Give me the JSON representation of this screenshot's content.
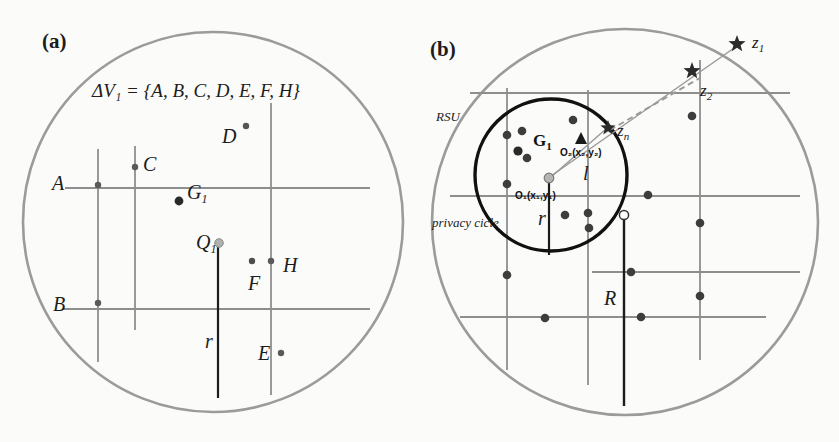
{
  "figure": {
    "background_color": "#fbfbf9",
    "width": 839,
    "height": 442
  },
  "panels": [
    {
      "tag": "(a)",
      "tag_x": 42,
      "tag_y": 48,
      "boundary": {
        "name": "coverage-circle",
        "cx": 213,
        "cy": 222,
        "r": 190,
        "color": "#9b9b9b",
        "stroke_width": 2.6
      },
      "formula": "ΔV₁ = {A, B, C, D, E, F, H}",
      "formula_x": 92,
      "formula_y": 97,
      "roads": [
        {
          "name": "road-vertical-1",
          "x1": 98,
          "y1": 149,
          "x2": 98,
          "y2": 362,
          "color": "#8e8e8e",
          "w": 1.8
        },
        {
          "name": "road-vertical-2",
          "x1": 135,
          "y1": 146,
          "x2": 135,
          "y2": 330,
          "color": "#8e8e8e",
          "w": 1.8
        },
        {
          "name": "road-vertical-3",
          "x1": 271,
          "y1": 103,
          "x2": 271,
          "y2": 395,
          "color": "#8e8e8e",
          "w": 1.8
        },
        {
          "name": "road-horizontal-1",
          "x1": 65,
          "y1": 188,
          "x2": 370,
          "y2": 188,
          "color": "#8e8e8e",
          "w": 1.8
        },
        {
          "name": "road-horizontal-2",
          "x1": 62,
          "y1": 309,
          "x2": 370,
          "y2": 309,
          "color": "#8e8e8e",
          "w": 1.8
        },
        {
          "name": "road-vertical-bold-r",
          "x1": 218,
          "y1": 243,
          "x2": 218,
          "y2": 398,
          "color": "#1c1c1c",
          "w": 2.2
        }
      ],
      "vehicles": [
        {
          "name": "vehicle-A",
          "label": "A",
          "lx": 52,
          "ly": 190,
          "cx": 98,
          "cy": 185,
          "r": 3.2,
          "fill": "#5a5a5a",
          "sub": ""
        },
        {
          "name": "vehicle-C",
          "label": "C",
          "lx": 143,
          "ly": 171,
          "cx": 135,
          "cy": 167,
          "r": 3.2,
          "fill": "#5a5a5a",
          "sub": ""
        },
        {
          "name": "vehicle-D",
          "label": "D",
          "lx": 222,
          "ly": 143,
          "cx": 246,
          "cy": 126,
          "r": 3.2,
          "fill": "#555555",
          "sub": ""
        },
        {
          "name": "vehicle-B",
          "label": "B",
          "lx": 53,
          "ly": 311,
          "cx": 98,
          "cy": 303,
          "r": 3.2,
          "fill": "#5a5a5a",
          "sub": ""
        },
        {
          "name": "vehicle-F",
          "label": "F",
          "lx": 248,
          "ly": 290,
          "cx": 252,
          "cy": 261,
          "r": 3.2,
          "fill": "#4e4e4e",
          "sub": ""
        },
        {
          "name": "vehicle-H",
          "label": "H",
          "lx": 283,
          "ly": 272,
          "cx": 271,
          "cy": 261,
          "r": 3.2,
          "fill": "#5a5a5a",
          "sub": ""
        },
        {
          "name": "vehicle-E",
          "label": "E",
          "lx": 258,
          "ly": 360,
          "cx": 281,
          "cy": 353,
          "r": 3.2,
          "fill": "#5a5a5a",
          "sub": ""
        }
      ],
      "group_point": {
        "name": "group-center-G1",
        "label": "G",
        "sub": "1",
        "lx": 187,
        "ly": 199,
        "cx": 179,
        "cy": 201,
        "r": 4.4,
        "fill": "#2a2a2a"
      },
      "query_point": {
        "name": "query-point-Q1",
        "label": "Q",
        "sub": "1",
        "lx": 196,
        "ly": 249,
        "cx": 219,
        "cy": 243,
        "r": 4.3,
        "fill": "#b0b0b0",
        "stroke": "#8a8a8a"
      },
      "radius_label": {
        "name": "radius-label-r",
        "text": "r",
        "x": 205,
        "y": 348
      }
    },
    {
      "tag": "(b)",
      "tag_x": 430,
      "tag_y": 56,
      "boundary": {
        "name": "rsu-coverage-circle",
        "cx": 625,
        "cy": 222,
        "r": 193,
        "color": "#9b9b9b",
        "stroke_width": 2.6
      },
      "rsu_label": {
        "name": "rsu-label",
        "text": "RSU",
        "x": 436,
        "y": 121
      },
      "privacy_label": {
        "name": "privacy-circle-label",
        "text": "privacy cicle",
        "x": 432,
        "y": 227
      },
      "privacy_circle": {
        "name": "privacy-circle",
        "cx": 551,
        "cy": 175,
        "r": 76,
        "color": "#111111",
        "stroke_width": 3.4
      },
      "roads": [
        {
          "name": "road-vertical-b1",
          "x1": 507,
          "y1": 88,
          "x2": 507,
          "y2": 370,
          "color": "#8e8e8e",
          "w": 1.8
        },
        {
          "name": "road-vertical-b2",
          "x1": 588,
          "y1": 90,
          "x2": 588,
          "y2": 385,
          "color": "#8e8e8e",
          "w": 1.8
        },
        {
          "name": "road-vertical-b3",
          "x1": 700,
          "y1": 60,
          "x2": 700,
          "y2": 360,
          "color": "#8e8e8e",
          "w": 1.8
        },
        {
          "name": "road-horizontal-b1",
          "x1": 470,
          "y1": 93,
          "x2": 790,
          "y2": 93,
          "color": "#8e8e8e",
          "w": 1.8
        },
        {
          "name": "road-horizontal-b2",
          "x1": 450,
          "y1": 196,
          "x2": 800,
          "y2": 196,
          "color": "#8e8e8e",
          "w": 1.8
        },
        {
          "name": "road-horizontal-b3",
          "x1": 592,
          "y1": 272,
          "x2": 800,
          "y2": 272,
          "color": "#8e8e8e",
          "w": 1.8
        },
        {
          "name": "road-horizontal-b4",
          "x1": 460,
          "y1": 317,
          "x2": 766,
          "y2": 317,
          "color": "#8e8e8e",
          "w": 1.8
        },
        {
          "name": "road-vertical-bold-r",
          "x1": 549,
          "y1": 178,
          "x2": 549,
          "y2": 255,
          "color": "#1c1c1c",
          "w": 2.2
        },
        {
          "name": "road-vertical-bold-R",
          "x1": 624,
          "y1": 215,
          "x2": 624,
          "y2": 406,
          "color": "#1c1c1c",
          "w": 2.4
        }
      ],
      "vehicles": [
        {
          "name": "vehicle-dot-1",
          "cx": 507,
          "cy": 135,
          "r": 4.3
        },
        {
          "name": "vehicle-dot-2",
          "cx": 522,
          "cy": 131,
          "r": 4.3
        },
        {
          "name": "vehicle-dot-3",
          "cx": 573,
          "cy": 120,
          "r": 4.3
        },
        {
          "name": "vehicle-dot-4",
          "cx": 527,
          "cy": 158,
          "r": 4.3
        },
        {
          "name": "vehicle-dot-5",
          "cx": 507,
          "cy": 184,
          "r": 4.3
        },
        {
          "name": "vehicle-dot-6",
          "cx": 565,
          "cy": 215,
          "r": 4.3
        },
        {
          "name": "vehicle-dot-7",
          "cx": 588,
          "cy": 213,
          "r": 4.3
        },
        {
          "name": "vehicle-dot-8",
          "cx": 589,
          "cy": 228,
          "r": 4.3
        },
        {
          "name": "vehicle-dot-9",
          "cx": 648,
          "cy": 195,
          "r": 4.3
        },
        {
          "name": "vehicle-dot-10",
          "cx": 692,
          "cy": 116,
          "r": 4.3
        },
        {
          "name": "vehicle-dot-11",
          "cx": 700,
          "cy": 223,
          "r": 4.3
        },
        {
          "name": "vehicle-dot-12",
          "cx": 507,
          "cy": 275,
          "r": 4.3
        },
        {
          "name": "vehicle-dot-13",
          "cx": 631,
          "cy": 272,
          "r": 4.3
        },
        {
          "name": "vehicle-dot-14",
          "cx": 700,
          "cy": 296,
          "r": 4.3
        },
        {
          "name": "vehicle-dot-15",
          "cx": 545,
          "cy": 318,
          "r": 4.3
        },
        {
          "name": "vehicle-dot-16",
          "cx": 641,
          "cy": 317,
          "r": 4.3
        }
      ],
      "vehicle_fill": "#3d3d3d",
      "group_label": {
        "name": "group-label-G1",
        "text": "G",
        "sub": "1",
        "x": 533,
        "y": 146
      },
      "group_dot": {
        "name": "group-dot-G1",
        "cx": 518,
        "cy": 151,
        "r": 4.6
      },
      "origin1": {
        "name": "origin-O1",
        "label": "O₁(x₁,y₁)",
        "lx": 515,
        "ly": 199,
        "cx": 549,
        "cy": 178,
        "r": 4.8,
        "fill": "#b5b5b5",
        "stroke": "#7a7a7a"
      },
      "origin2": {
        "name": "origin-O2",
        "label": "O₂(x₂,y₂)",
        "lx": 560,
        "ly": 156,
        "marker_x": 581,
        "marker_y": 140
      },
      "open_dot": {
        "name": "open-vehicle-dot",
        "cx": 624,
        "cy": 215,
        "r": 4.6,
        "fill": "#ffffff",
        "stroke": "#333333"
      },
      "radius_label_r": {
        "name": "privacy-radius-label-r",
        "text": "r",
        "x": 538,
        "y": 225
      },
      "radius_label_R": {
        "name": "rsu-radius-label-R",
        "text": "R",
        "x": 604,
        "y": 305
      },
      "distance_label_l": {
        "name": "distance-label-l",
        "text": "l",
        "x": 583,
        "y": 180
      },
      "stars": [
        {
          "name": "star-z1",
          "cx": 737,
          "cy": 44,
          "size": 9,
          "label": "z",
          "sub": "1",
          "lx": 752,
          "ly": 48
        },
        {
          "name": "star-z2",
          "cx": 692,
          "cy": 71,
          "size": 9,
          "label": "z",
          "sub": "2",
          "lx": 700,
          "ly": 96
        },
        {
          "name": "star-zn",
          "cx": 608,
          "cy": 128,
          "size": 8,
          "label": "z",
          "sub": "n",
          "lx": 617,
          "ly": 136
        }
      ],
      "connector_lines": [
        {
          "name": "line-o1-to-z1",
          "x1": 551,
          "y1": 176,
          "x2": 737,
          "y2": 46,
          "color": "#9a9a9a",
          "w": 1.5,
          "dash": "none"
        },
        {
          "name": "line-o1-to-zn",
          "x1": 551,
          "y1": 177,
          "x2": 606,
          "y2": 129,
          "color": "#9a9a9a",
          "w": 1.5,
          "dash": "none"
        },
        {
          "name": "line-zn-to-z2-dashed",
          "x1": 610,
          "y1": 130,
          "x2": 700,
          "y2": 78,
          "color": "#9a9a9a",
          "w": 2.0,
          "dash": "6,4"
        }
      ]
    }
  ]
}
